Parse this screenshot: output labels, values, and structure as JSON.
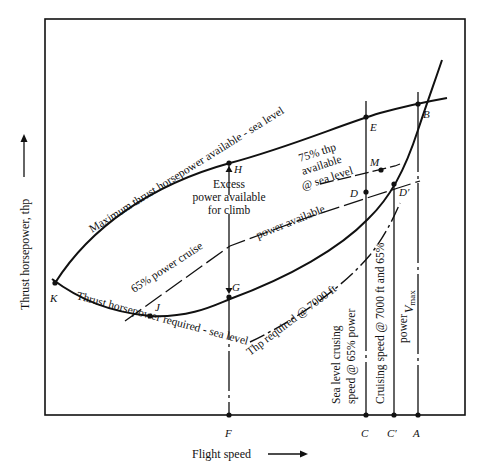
{
  "diagram": {
    "type": "performance-curves",
    "axes": {
      "x_label": "Flight speed",
      "y_label": "Thrust horsepower, thp"
    },
    "curves": {
      "max_available": "Maximum thrust horsepower available - sea level",
      "required_sl": "Thrust horsepower required - sea level",
      "required_7000": "Thp required @ 7000 ft",
      "cruise_65_a": "65% power cruise",
      "cruise_65_b": "power available",
      "thp_75_line1": "75% thp",
      "thp_75_line2": "available",
      "thp_75_line3": "@ sea level"
    },
    "annotations": {
      "excess_line1": "Excess",
      "excess_line2": "power available",
      "excess_line3": "for climb",
      "sl_cruise_line1": "Sea level crusing",
      "sl_cruise_line2": "speed @ 65% power",
      "cruise7000_line1": "Cruising speed @ 7000 ft and 65%",
      "cruise7000_line2": "power",
      "vmax_main": "V",
      "vmax_sub": "max"
    },
    "points": {
      "A": "A",
      "B": "B",
      "C": "C",
      "C_prime": "C′",
      "D": "D",
      "D_prime": "D′",
      "E": "E",
      "F": "F",
      "G": "G",
      "H": "H",
      "J": "J",
      "K": "K",
      "M": "M"
    }
  }
}
